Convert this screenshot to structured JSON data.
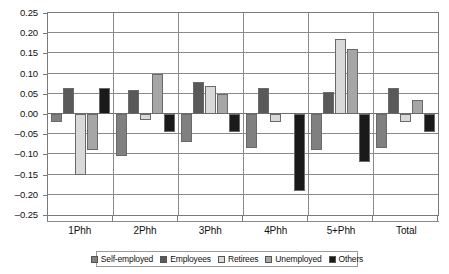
{
  "chart_data": {
    "type": "bar",
    "title": "",
    "subtitle": "",
    "xlabel": "",
    "ylabel": "",
    "grid": true,
    "legend_position": "bottom",
    "orientation": "vertical",
    "grouping": "clustered",
    "categories": [
      "1Phh",
      "2Phh",
      "3Phh",
      "4Phh",
      "5+Phh",
      "Total"
    ],
    "ylim": [
      -0.25,
      0.25
    ],
    "ytick_step": 0.05,
    "yticks": [
      0.25,
      0.2,
      0.15,
      0.1,
      0.05,
      0.0,
      -0.05,
      -0.1,
      -0.15,
      -0.2,
      -0.25
    ],
    "ytick_labels": [
      "0.25",
      "0.20",
      "0.15",
      "0.10",
      "0.05",
      "0.00",
      "–0.05",
      "–0.10",
      "–0.15",
      "–0.20",
      "–0.25"
    ],
    "series": [
      {
        "name": "Self-employed",
        "color": "#808080",
        "values": [
          -0.02,
          -0.105,
          -0.07,
          -0.085,
          -0.09,
          -0.085
        ]
      },
      {
        "name": "Employees",
        "color": "#595959",
        "values": [
          0.065,
          0.06,
          0.08,
          0.065,
          0.055,
          0.065
        ]
      },
      {
        "name": "Retirees",
        "color": "#d9d9d9",
        "values": [
          -0.15,
          -0.015,
          0.07,
          -0.02,
          0.185,
          -0.02
        ]
      },
      {
        "name": "Unemployed",
        "color": "#a6a6a6",
        "values": [
          -0.09,
          0.1,
          0.05,
          0.0,
          0.16,
          0.035
        ]
      },
      {
        "name": "Others",
        "color": "#1a1a1a",
        "values": [
          0.065,
          -0.045,
          -0.045,
          -0.19,
          -0.12,
          -0.045
        ]
      }
    ]
  },
  "legend": {
    "items": [
      {
        "label": "Self-employed"
      },
      {
        "label": "Employees"
      },
      {
        "label": "Retirees"
      },
      {
        "label": "Unemployed"
      },
      {
        "label": "Others"
      }
    ]
  }
}
